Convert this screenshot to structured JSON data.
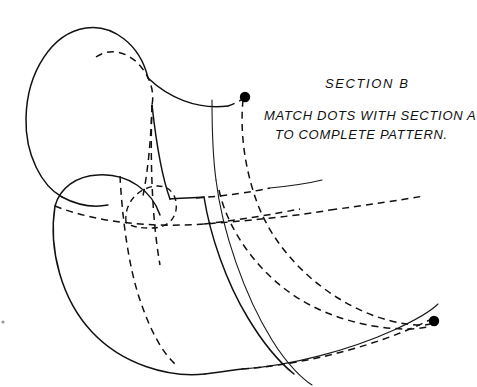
{
  "page": {
    "width": 477,
    "height": 387,
    "background_color": "#ffffff",
    "ink_color": "#111111"
  },
  "annotations": {
    "section_title": "SECTION B",
    "instruction_line_1": "MATCH DOTS WITH  SECTION A",
    "instruction_line_2": "TO COMPLETE PATTERN."
  },
  "markers": [
    {
      "name": "upper-connection-dot",
      "cx": 245,
      "cy": 97,
      "r": 5.2,
      "color": "#000000"
    },
    {
      "name": "lower-connection-dot",
      "cx": 434,
      "cy": 321,
      "r": 5.2,
      "color": "#000000"
    }
  ],
  "geometry": {
    "upper_lobe_outline": "M 148 78 C 140 44 112 24 86 28 C 52 33 27 72 26 118 C 25 155 42 186 62 197",
    "upper_lobe_lower_left": "M 62 197 C 75 204 92 208 108 205",
    "upper_lobe_inner_dashed": "M 96 57 C 112 46 134 53 146 74 C 152 84 154 95 152 105",
    "upper_ridge_right": "M 148 78 C 168 97 196 110 228 106",
    "crest_to_dot_dashed": "M 228 106 C 234 104 239 101 243 99",
    "front_fold_solid": "M 152 105 C 157 150 163 180 170 199",
    "upper_band_left_dashed": "M 152 105 C 151 140 148 170 143 196",
    "lower_lobe_outline": "M 55 206 C 60 188 76 176 98 175 C 128 173 152 191 160 215",
    "lower_lobe_left_solid": "M 55 206 C 48 250 62 300 92 332 C 122 364 168 378 205 374",
    "lower_lobe_bottom": "M 205 374 C 222 372 235 370 242 369",
    "lower_equator_dashed": "M 55 206 C 95 222 150 228 204 224 C 258 220 302 215 330 210",
    "lower_equator_dashed_far": "M 330 210 C 368 205 400 200 424 196",
    "small_dashed_oval": "M 126 222 C 124 203 138 188 156 186 C 170 185 178 196 176 210 C 174 222 164 228 152 228 C 140 228 130 227 126 222",
    "inner_dashed_vertical": "M 120 176 C 122 215 128 265 140 300 C 150 330 162 352 175 364",
    "mid_dashed_vertical": "M 152 105 C 150 160 152 220 160 265",
    "spine_solid_thin": "M 216 180 C 222 230 244 295 272 340 C 288 366 304 380 312 385",
    "spine_solid_upper": "M 212 100 C 212 130 213 158 216 180",
    "main_dashed_from_dot": "M 243 100 C 240 130 244 168 258 205 C 276 252 320 295 372 315 C 396 324 420 327 430 324",
    "inner_dashed_band": "M 219 190 C 228 232 262 280 310 305 C 348 325 398 333 428 327",
    "lower_outer_solid": "M 242 369 C 290 366 350 350 394 330 C 418 319 432 310 438 304",
    "lower_dashed_tail": "M 242 369 C 300 365 360 349 400 333 C 420 325 430 320 433 318",
    "ridge_band_dashed_short": "M 204 224 C 240 220 274 214 300 209",
    "top_band_dashed_short": "M 196 198 C 226 196 252 192 270 188",
    "front_panel_solid": "M 170 199 C 178 198 192 198 204 197",
    "lower_front_fold": "M 204 197 C 210 235 226 282 248 318 C 266 348 284 366 294 374",
    "right_edge_arc": "M 270 188 C 290 186 310 183 322 180"
  },
  "speck": {
    "name": "page-speck",
    "cx": 3,
    "cy": 322,
    "r": 1.6
  }
}
